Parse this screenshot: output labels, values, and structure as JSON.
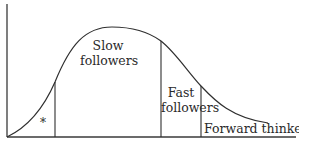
{
  "diagram": {
    "type": "adoption-curve",
    "segments": [
      {
        "id": "early",
        "label": "*"
      },
      {
        "id": "slow",
        "label_line1": "Slow",
        "label_line2": "followers"
      },
      {
        "id": "fast",
        "label_line1": "Fast",
        "label_line2": "followers"
      },
      {
        "id": "forward",
        "label": "Forward thinkers"
      }
    ],
    "colors": {
      "line": "#2f2f2f",
      "background": "#ffffff"
    }
  }
}
